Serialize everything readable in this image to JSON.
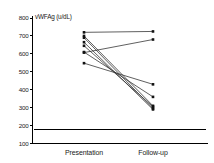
{
  "chart_data": {
    "type": "line",
    "title": "",
    "subtitle": "",
    "xlabel": "",
    "ylabel": "vWFAg (u/dL)",
    "categories": [
      "Presentation",
      "Follow-up"
    ],
    "x_tick_labels": [
      "Presentation",
      "Follow-up"
    ],
    "y_tick_labels": [
      "100",
      "200",
      "300",
      "400",
      "500",
      "600",
      "700",
      "800"
    ],
    "y_ticks": [
      100,
      200,
      300,
      400,
      500,
      600,
      700,
      800
    ],
    "ylim": [
      100,
      800
    ],
    "grid": false,
    "legend": false,
    "legend_position": "none",
    "marker": "square",
    "annotations": [
      {
        "name": "reference-line",
        "type": "horizontal-line",
        "value": 180,
        "label": ""
      }
    ],
    "series": [
      {
        "name": "subject-1",
        "values": [
          720,
          725
        ]
      },
      {
        "name": "subject-2",
        "values": [
          607,
          680
        ]
      },
      {
        "name": "subject-3",
        "values": [
          700,
          310
        ]
      },
      {
        "name": "subject-4",
        "values": [
          690,
          295
        ]
      },
      {
        "name": "subject-5",
        "values": [
          665,
          290
        ]
      },
      {
        "name": "subject-6",
        "values": [
          645,
          305
        ]
      },
      {
        "name": "subject-7",
        "values": [
          610,
          360
        ]
      },
      {
        "name": "subject-8",
        "values": [
          548,
          430
        ]
      }
    ]
  },
  "colors": {
    "axis": "#000000",
    "line": "#2b2b2b",
    "marker": "#111111",
    "reference": "#000000",
    "background": "#ffffff"
  }
}
